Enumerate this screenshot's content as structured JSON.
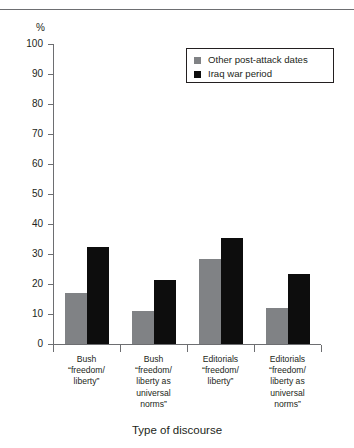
{
  "caption": {
    "clipped_heading": "FIGURE 1  DISCOURSE OF FREEDOM AND LIBERTY"
  },
  "axis": {
    "y_unit_label": "%",
    "y_ticks": [
      100,
      90,
      80,
      70,
      60,
      50,
      40,
      30,
      20,
      10,
      0
    ],
    "x_title": "Type of discourse"
  },
  "legend": {
    "items": [
      {
        "label": "Other post-attack dates",
        "color": "#808285",
        "swatch_name": "legend-swatch-gray"
      },
      {
        "label": "Iraq war period",
        "color": "#0d0d0d",
        "swatch_name": "legend-swatch-black"
      }
    ]
  },
  "categories": [
    {
      "lines": [
        "Bush",
        "“freedom/",
        "liberty”"
      ]
    },
    {
      "lines": [
        "Bush",
        "“freedom/",
        "liberty as",
        "universal",
        "norms”"
      ]
    },
    {
      "lines": [
        "Editorials",
        "“freedom/",
        "liberty”"
      ]
    },
    {
      "lines": [
        "Editorials",
        "“freedom/",
        "liberty as",
        "universal",
        "norms”"
      ]
    }
  ],
  "chart_data": {
    "type": "bar",
    "title": "",
    "xlabel": "Type of discourse",
    "ylabel": "%",
    "ylim": [
      0,
      100
    ],
    "yticks": [
      0,
      10,
      20,
      30,
      40,
      50,
      60,
      70,
      80,
      90,
      100
    ],
    "grid": false,
    "legend_position": "upper-right-inset",
    "categories": [
      "Bush “freedom/liberty”",
      "Bush “freedom/liberty as universal norms”",
      "Editorials “freedom/liberty”",
      "Editorials “freedom/liberty as universal norms”"
    ],
    "series": [
      {
        "name": "Other post-attack dates",
        "color": "#808285",
        "values": [
          17,
          11,
          28.5,
          12
        ]
      },
      {
        "name": "Iraq war period",
        "color": "#0d0d0d",
        "values": [
          32.5,
          21.5,
          35.5,
          23.5
        ]
      }
    ]
  }
}
